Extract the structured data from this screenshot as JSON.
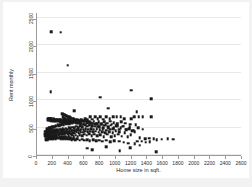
{
  "chart_data": {
    "type": "scatter",
    "title": "",
    "xlabel": "Home size in sqft.",
    "ylabel": "Rent monthly",
    "xlim": [
      0,
      2600
    ],
    "ylim": [
      0,
      2600
    ],
    "xticks": [
      0,
      200,
      400,
      600,
      800,
      1000,
      1200,
      1400,
      1600,
      1800,
      2000,
      2200,
      2400,
      2600
    ],
    "yticks": [
      0,
      500,
      1000,
      1500,
      2000,
      2500
    ],
    "grid": "horizontal",
    "legend": "none",
    "marker": {
      "shape": "square",
      "color": "#1a1a1a",
      "size": 2.6
    },
    "background": "#ffffff",
    "figure_background": "#f2f2f2",
    "points": [
      [
        178,
        2235
      ],
      [
        300,
        2232
      ],
      [
        388,
        1632
      ],
      [
        172,
        1148
      ],
      [
        800,
        1050
      ],
      [
        1198,
        1178
      ],
      [
        1452,
        1020
      ],
      [
        470,
        800
      ],
      [
        905,
        850
      ],
      [
        1262,
        790
      ],
      [
        1448,
        700
      ],
      [
        1340,
        690
      ],
      [
        1290,
        700
      ],
      [
        1230,
        695
      ],
      [
        1198,
        660
      ],
      [
        1108,
        660
      ],
      [
        1060,
        690
      ],
      [
        1012,
        700
      ],
      [
        965,
        700
      ],
      [
        920,
        660
      ],
      [
        878,
        690
      ],
      [
        840,
        650
      ],
      [
        800,
        700
      ],
      [
        772,
        660
      ],
      [
        740,
        700
      ],
      [
        700,
        650
      ],
      [
        672,
        690
      ],
      [
        640,
        640
      ],
      [
        610,
        660
      ],
      [
        588,
        620
      ],
      [
        560,
        640
      ],
      [
        535,
        600
      ],
      [
        512,
        630
      ],
      [
        492,
        600
      ],
      [
        470,
        620
      ],
      [
        450,
        580
      ],
      [
        430,
        600
      ],
      [
        412,
        570
      ],
      [
        392,
        590
      ],
      [
        374,
        560
      ],
      [
        356,
        580
      ],
      [
        340,
        550
      ],
      [
        322,
        565
      ],
      [
        308,
        540
      ],
      [
        292,
        555
      ],
      [
        278,
        530
      ],
      [
        264,
        545
      ],
      [
        250,
        520
      ],
      [
        238,
        535
      ],
      [
        224,
        510
      ],
      [
        212,
        525
      ],
      [
        200,
        500
      ],
      [
        190,
        515
      ],
      [
        178,
        490
      ],
      [
        168,
        505
      ],
      [
        158,
        480
      ],
      [
        148,
        495
      ],
      [
        140,
        470
      ],
      [
        132,
        485
      ],
      [
        124,
        460
      ],
      [
        1520,
        280
      ],
      [
        1580,
        285
      ],
      [
        1660,
        290
      ],
      [
        1730,
        285
      ],
      [
        1480,
        300
      ],
      [
        1420,
        305
      ],
      [
        1370,
        300
      ],
      [
        1330,
        250
      ],
      [
        1300,
        310
      ],
      [
        1270,
        250
      ],
      [
        1240,
        420
      ],
      [
        1210,
        440
      ],
      [
        1190,
        370
      ],
      [
        1170,
        480
      ],
      [
        1150,
        330
      ],
      [
        1130,
        470
      ],
      [
        1110,
        400
      ],
      [
        1090,
        520
      ],
      [
        1075,
        340
      ],
      [
        1060,
        490
      ],
      [
        1045,
        420
      ],
      [
        1030,
        380
      ],
      [
        1015,
        530
      ],
      [
        1000,
        440
      ],
      [
        988,
        350
      ],
      [
        975,
        490
      ],
      [
        962,
        400
      ],
      [
        950,
        560
      ],
      [
        938,
        330
      ],
      [
        925,
        470
      ],
      [
        912,
        420
      ],
      [
        900,
        520
      ],
      [
        890,
        380
      ],
      [
        878,
        450
      ],
      [
        866,
        400
      ],
      [
        855,
        540
      ],
      [
        845,
        330
      ],
      [
        835,
        480
      ],
      [
        825,
        420
      ],
      [
        815,
        560
      ],
      [
        805,
        370
      ],
      [
        795,
        460
      ],
      [
        785,
        410
      ],
      [
        775,
        520
      ],
      [
        765,
        350
      ],
      [
        756,
        480
      ],
      [
        746,
        430
      ],
      [
        737,
        560
      ],
      [
        728,
        380
      ],
      [
        719,
        470
      ],
      [
        710,
        420
      ],
      [
        701,
        530
      ],
      [
        692,
        350
      ],
      [
        684,
        480
      ],
      [
        676,
        430
      ],
      [
        668,
        550
      ],
      [
        660,
        390
      ],
      [
        652,
        470
      ],
      [
        644,
        420
      ],
      [
        636,
        520
      ],
      [
        628,
        360
      ],
      [
        620,
        480
      ],
      [
        613,
        430
      ],
      [
        606,
        540
      ],
      [
        598,
        380
      ],
      [
        591,
        460
      ],
      [
        584,
        410
      ],
      [
        577,
        510
      ],
      [
        570,
        350
      ],
      [
        563,
        470
      ],
      [
        556,
        420
      ],
      [
        549,
        530
      ],
      [
        543,
        370
      ],
      [
        536,
        450
      ],
      [
        530,
        400
      ],
      [
        523,
        500
      ],
      [
        517,
        340
      ],
      [
        510,
        460
      ],
      [
        504,
        410
      ],
      [
        498,
        520
      ],
      [
        492,
        360
      ],
      [
        486,
        440
      ],
      [
        480,
        395
      ],
      [
        474,
        490
      ],
      [
        468,
        330
      ],
      [
        462,
        450
      ],
      [
        456,
        405
      ],
      [
        450,
        505
      ],
      [
        444,
        355
      ],
      [
        439,
        435
      ],
      [
        433,
        390
      ],
      [
        428,
        480
      ],
      [
        422,
        325
      ],
      [
        417,
        445
      ],
      [
        411,
        400
      ],
      [
        406,
        495
      ],
      [
        400,
        345
      ],
      [
        395,
        430
      ],
      [
        390,
        385
      ],
      [
        385,
        470
      ],
      [
        380,
        320
      ],
      [
        375,
        440
      ],
      [
        370,
        395
      ],
      [
        365,
        485
      ],
      [
        360,
        340
      ],
      [
        355,
        425
      ],
      [
        350,
        380
      ],
      [
        345,
        465
      ],
      [
        340,
        315
      ],
      [
        336,
        435
      ],
      [
        331,
        390
      ],
      [
        326,
        475
      ],
      [
        322,
        335
      ],
      [
        317,
        420
      ],
      [
        312,
        375
      ],
      [
        308,
        455
      ],
      [
        303,
        310
      ],
      [
        299,
        430
      ],
      [
        294,
        385
      ],
      [
        290,
        465
      ],
      [
        286,
        330
      ],
      [
        281,
        415
      ],
      [
        277,
        370
      ],
      [
        273,
        450
      ],
      [
        269,
        305
      ],
      [
        265,
        425
      ],
      [
        260,
        380
      ],
      [
        256,
        460
      ],
      [
        252,
        325
      ],
      [
        248,
        410
      ],
      [
        244,
        365
      ],
      [
        240,
        445
      ],
      [
        236,
        300
      ],
      [
        233,
        420
      ],
      [
        229,
        375
      ],
      [
        225,
        455
      ],
      [
        221,
        320
      ],
      [
        218,
        405
      ],
      [
        214,
        360
      ],
      [
        210,
        440
      ],
      [
        207,
        295
      ],
      [
        203,
        415
      ],
      [
        200,
        370
      ],
      [
        196,
        450
      ],
      [
        193,
        315
      ],
      [
        189,
        400
      ],
      [
        186,
        355
      ],
      [
        182,
        435
      ],
      [
        179,
        290
      ],
      [
        176,
        410
      ],
      [
        172,
        365
      ],
      [
        169,
        445
      ],
      [
        166,
        310
      ],
      [
        163,
        395
      ],
      [
        159,
        350
      ],
      [
        156,
        430
      ],
      [
        153,
        285
      ],
      [
        150,
        405
      ],
      [
        147,
        360
      ],
      [
        144,
        440
      ],
      [
        141,
        305
      ],
      [
        138,
        390
      ],
      [
        135,
        345
      ],
      [
        132,
        425
      ],
      [
        129,
        280
      ],
      [
        126,
        400
      ],
      [
        124,
        355
      ],
      [
        121,
        435
      ],
      [
        118,
        300
      ],
      [
        116,
        385
      ],
      [
        113,
        340
      ],
      [
        110,
        420
      ],
      [
        108,
        275
      ],
      [
        105,
        395
      ],
      [
        103,
        350
      ],
      [
        100,
        430
      ],
      [
        1510,
        60
      ],
      [
        1050,
        75
      ],
      [
        700,
        100
      ],
      [
        640,
        120
      ],
      [
        1180,
        130
      ],
      [
        880,
        150
      ],
      [
        1380,
        230
      ],
      [
        1430,
        240
      ],
      [
        1300,
        180
      ],
      [
        1240,
        200
      ],
      [
        1160,
        210
      ],
      [
        1100,
        230
      ],
      [
        1040,
        250
      ],
      [
        980,
        260
      ],
      [
        930,
        240
      ],
      [
        880,
        265
      ],
      [
        830,
        250
      ],
      [
        790,
        270
      ],
      [
        750,
        255
      ],
      [
        710,
        275
      ],
      [
        670,
        260
      ],
      [
        635,
        280
      ],
      [
        600,
        265
      ],
      [
        570,
        285
      ],
      [
        540,
        270
      ],
      [
        512,
        290
      ],
      [
        486,
        275
      ],
      [
        462,
        295
      ],
      [
        440,
        280
      ],
      [
        418,
        300
      ],
      [
        398,
        285
      ],
      [
        380,
        305
      ],
      [
        362,
        290
      ],
      [
        345,
        310
      ],
      [
        330,
        295
      ],
      [
        315,
        315
      ],
      [
        300,
        300
      ],
      [
        286,
        320
      ],
      [
        273,
        305
      ],
      [
        260,
        325
      ],
      [
        248,
        310
      ],
      [
        237,
        330
      ],
      [
        226,
        315
      ],
      [
        216,
        335
      ],
      [
        206,
        320
      ],
      [
        197,
        340
      ],
      [
        188,
        325
      ],
      [
        180,
        345
      ],
      [
        172,
        330
      ],
      [
        164,
        350
      ],
      [
        157,
        335
      ],
      [
        150,
        355
      ],
      [
        143,
        340
      ],
      [
        137,
        360
      ],
      [
        131,
        345
      ],
      [
        125,
        365
      ],
      [
        119,
        350
      ],
      [
        114,
        370
      ],
      [
        109,
        355
      ],
      [
        104,
        375
      ],
      [
        1250,
        550
      ],
      [
        1180,
        560
      ],
      [
        1120,
        580
      ],
      [
        1070,
        600
      ],
      [
        1020,
        570
      ],
      [
        975,
        590
      ],
      [
        930,
        610
      ],
      [
        890,
        580
      ],
      [
        850,
        600
      ],
      [
        815,
        570
      ],
      [
        780,
        600
      ],
      [
        748,
        580
      ],
      [
        718,
        610
      ],
      [
        690,
        575
      ],
      [
        663,
        605
      ],
      [
        638,
        585
      ],
      [
        614,
        615
      ],
      [
        591,
        580
      ],
      [
        569,
        610
      ],
      [
        548,
        590
      ],
      [
        528,
        620
      ],
      [
        509,
        585
      ],
      [
        491,
        615
      ],
      [
        474,
        595
      ],
      [
        457,
        625
      ],
      [
        441,
        590
      ],
      [
        426,
        620
      ],
      [
        411,
        600
      ],
      [
        397,
        630
      ],
      [
        384,
        595
      ],
      [
        371,
        625
      ],
      [
        359,
        605
      ],
      [
        347,
        635
      ],
      [
        336,
        600
      ],
      [
        325,
        630
      ],
      [
        315,
        610
      ],
      [
        305,
        640
      ],
      [
        295,
        605
      ],
      [
        286,
        635
      ],
      [
        277,
        615
      ],
      [
        268,
        645
      ],
      [
        260,
        610
      ],
      [
        252,
        640
      ],
      [
        244,
        620
      ],
      [
        237,
        650
      ],
      [
        230,
        615
      ],
      [
        223,
        645
      ],
      [
        216,
        625
      ],
      [
        210,
        655
      ],
      [
        204,
        620
      ],
      [
        198,
        650
      ],
      [
        192,
        630
      ],
      [
        186,
        660
      ],
      [
        181,
        625
      ],
      [
        176,
        655
      ],
      [
        171,
        635
      ],
      [
        166,
        665
      ],
      [
        161,
        630
      ],
      [
        157,
        660
      ],
      [
        152,
        640
      ],
      [
        148,
        670
      ],
      [
        144,
        635
      ],
      [
        140,
        665
      ],
      [
        136,
        645
      ],
      [
        1340,
        470
      ],
      [
        1280,
        490
      ],
      [
        1225,
        450
      ],
      [
        1175,
        510
      ],
      [
        1128,
        460
      ],
      [
        1085,
        520
      ],
      [
        1044,
        470
      ],
      [
        1005,
        530
      ],
      [
        968,
        480
      ],
      [
        934,
        540
      ],
      [
        901,
        490
      ],
      [
        870,
        550
      ],
      [
        841,
        500
      ],
      [
        813,
        560
      ],
      [
        787,
        510
      ],
      [
        762,
        570
      ],
      [
        738,
        520
      ],
      [
        715,
        580
      ],
      [
        694,
        530
      ],
      [
        673,
        590
      ],
      [
        654,
        540
      ],
      [
        635,
        600
      ],
      [
        617,
        550
      ],
      [
        600,
        610
      ],
      [
        583,
        560
      ],
      [
        568,
        620
      ],
      [
        553,
        570
      ],
      [
        538,
        630
      ],
      [
        525,
        580
      ],
      [
        511,
        640
      ],
      [
        499,
        590
      ],
      [
        487,
        650
      ],
      [
        475,
        600
      ],
      [
        464,
        660
      ],
      [
        453,
        610
      ],
      [
        443,
        670
      ],
      [
        433,
        620
      ],
      [
        423,
        680
      ],
      [
        414,
        630
      ],
      [
        405,
        690
      ],
      [
        396,
        640
      ],
      [
        388,
        700
      ],
      [
        380,
        650
      ],
      [
        372,
        710
      ],
      [
        365,
        660
      ],
      [
        358,
        720
      ],
      [
        351,
        670
      ],
      [
        344,
        730
      ],
      [
        338,
        680
      ],
      [
        331,
        740
      ],
      [
        325,
        690
      ],
      [
        319,
        750
      ]
    ]
  }
}
